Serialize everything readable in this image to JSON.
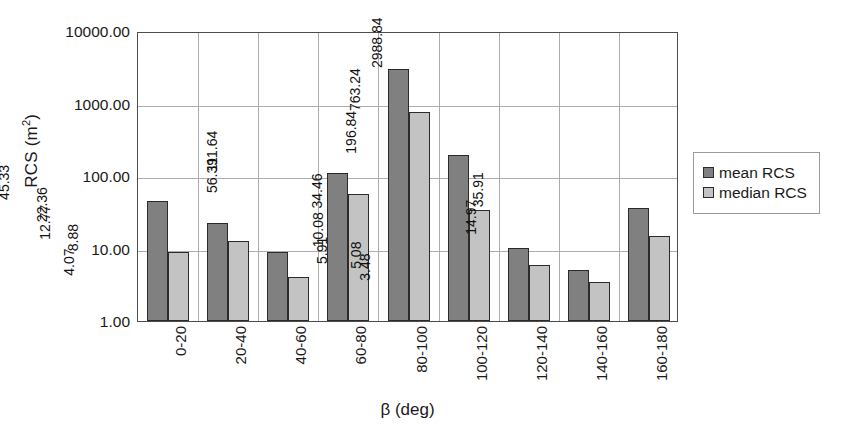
{
  "chart_data": {
    "type": "bar",
    "title": "",
    "xlabel": "β (deg)",
    "ylabel": "RCS (m²)",
    "ylabel_base": "RCS (m",
    "ylabel_sup": "2",
    "ylabel_tail": ")",
    "yscale": "log",
    "ylim": [
      1,
      10000
    ],
    "grid": true,
    "legend_position": "right",
    "categories": [
      "0-20",
      "20-40",
      "40-60",
      "60-80",
      "80-100",
      "100-120",
      "120-140",
      "140-160",
      "160-180"
    ],
    "y_ticks": [
      {
        "value": 10000,
        "label": "10000.00"
      },
      {
        "value": 1000,
        "label": "1000.00"
      },
      {
        "value": 100,
        "label": "100.00"
      },
      {
        "value": 10,
        "label": "10.00"
      },
      {
        "value": 1,
        "label": "1.00"
      }
    ],
    "series": [
      {
        "name": "mean RCS",
        "color": "#808080",
        "values": [
          45.33,
          22.36,
          8.88,
          111.64,
          2988.84,
          196.84,
          10.08,
          5.08,
          35.91
        ],
        "labels": [
          "45.33",
          "22.36",
          "8.88",
          "111.64",
          "2988.84",
          "196.84",
          "10.08",
          "5.08",
          "35.91"
        ]
      },
      {
        "name": "median RCS",
        "color": "#c3c3c3",
        "values": [
          9.05,
          12.77,
          4.07,
          56.39,
          763.24,
          34.46,
          5.91,
          3.48,
          14.97
        ],
        "labels": [
          "9.05",
          "12.77",
          "4.07",
          "56.39",
          "763.24",
          "34.46",
          "5.91",
          "3.48",
          "14.97"
        ]
      }
    ]
  },
  "legend": {
    "items": [
      {
        "label": "mean RCS",
        "color": "#808080"
      },
      {
        "label": "median RCS",
        "color": "#c3c3c3"
      }
    ]
  }
}
